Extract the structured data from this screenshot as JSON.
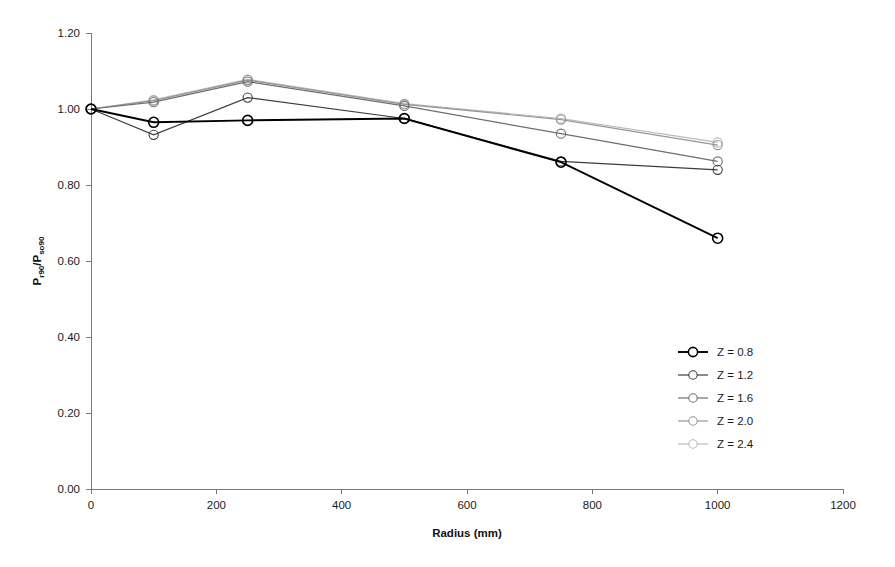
{
  "chart_data": {
    "type": "line",
    "title": "",
    "xlabel": "Radius (mm)",
    "ylabel": "Pr90/Pso90",
    "ylabel_parts": {
      "p1": "P",
      "sub1": "r90",
      "slash": "/P",
      "sub2": "so90"
    },
    "x": [
      0,
      100,
      250,
      500,
      750,
      1000
    ],
    "xlim": [
      0,
      1200
    ],
    "ylim": [
      0,
      1.2
    ],
    "xticks": [
      0,
      200,
      400,
      600,
      800,
      1000,
      1200
    ],
    "xtick_labels": [
      "0",
      "200",
      "400",
      "600",
      "800",
      "1000",
      "1200"
    ],
    "yticks": [
      0.0,
      0.2,
      0.4,
      0.6,
      0.8,
      1.0,
      1.2
    ],
    "ytick_labels": [
      "0.00",
      "0.20",
      "0.40",
      "0.60",
      "0.80",
      "1.00",
      "1.20"
    ],
    "grid": false,
    "legend_position": "right-middle",
    "marker": "circle-open",
    "series": [
      {
        "name": "Z = 0.8",
        "color": "#000000",
        "values": [
          1.0,
          0.965,
          0.97,
          0.975,
          0.86,
          0.66
        ]
      },
      {
        "name": "Z = 1.2",
        "color": "#3d3d3d",
        "values": [
          1.0,
          0.932,
          1.03,
          0.975,
          0.862,
          0.84
        ]
      },
      {
        "name": "Z = 1.6",
        "color": "#6e6e6e",
        "values": [
          1.0,
          1.018,
          1.072,
          1.008,
          0.935,
          0.862
        ]
      },
      {
        "name": "Z = 2.0",
        "color": "#969696",
        "values": [
          1.0,
          1.022,
          1.076,
          1.012,
          0.972,
          0.905
        ]
      },
      {
        "name": "Z = 2.4",
        "color": "#b9b9b9",
        "values": [
          1.0,
          1.024,
          1.078,
          1.014,
          0.975,
          0.912
        ]
      }
    ]
  },
  "geometry": {
    "plot_left": 91,
    "plot_right": 843,
    "plot_top": 33,
    "plot_bottom": 489,
    "legend_x": 678,
    "legend_y": 352,
    "legend_row_height": 23
  }
}
